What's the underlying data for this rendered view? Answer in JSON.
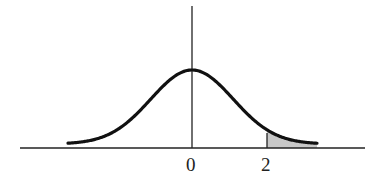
{
  "diagram": {
    "type": "normal-distribution-curve",
    "shaded_region": "right tail beyond 2",
    "colors": {
      "curve": "#111111",
      "axis": "#222222",
      "shade": "#c8c8c8"
    },
    "tick_labels": [
      {
        "value": "0",
        "x": 192
      },
      {
        "value": "2",
        "x": 267
      }
    ]
  },
  "chart_data": {
    "type": "area",
    "title": "",
    "xlabel": "",
    "ylabel": "",
    "distribution": "standard normal",
    "mean": 0,
    "x_ticks": [
      "0",
      "2"
    ],
    "shaded_interval": [
      2,
      "infinity"
    ],
    "grid": false
  }
}
